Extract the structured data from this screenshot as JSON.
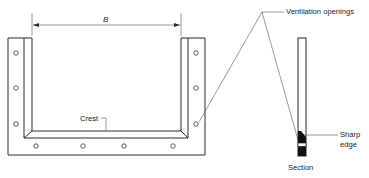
{
  "diagram": {
    "type": "weir-plate-elevation-and-section",
    "labels": {
      "dimension": "B",
      "crest": "Crest",
      "ventilation": "Ventilation openings",
      "sharp_edge_line1": "Sharp",
      "sharp_edge_line2": "edge",
      "section": "Section"
    },
    "frame": {
      "outer": {
        "x1": 8,
        "y1": 38,
        "x2": 205,
        "y2": 155
      },
      "left_post_inner_x": 24,
      "left_opening_x": 32,
      "right_opening_x": 181,
      "right_post_inner_x": 188,
      "crest_y": 131,
      "u_bottom_y": 138
    },
    "holes": {
      "left_column": [
        {
          "x": 16,
          "y": 53
        },
        {
          "x": 16,
          "y": 88
        },
        {
          "x": 16,
          "y": 124
        }
      ],
      "right_column": [
        {
          "x": 196,
          "y": 53
        },
        {
          "x": 196,
          "y": 88
        },
        {
          "x": 196,
          "y": 124
        }
      ],
      "bottom_row": [
        {
          "x": 36,
          "y": 145
        },
        {
          "x": 83,
          "y": 145
        },
        {
          "x": 124,
          "y": 145
        },
        {
          "x": 173,
          "y": 145
        }
      ]
    },
    "section_bar": {
      "x": 298,
      "y": 38,
      "width": 8,
      "height": 118
    },
    "colors": {
      "line": "#2a2a2a",
      "background": "#ffffff",
      "fill_dark": "#111111"
    }
  }
}
